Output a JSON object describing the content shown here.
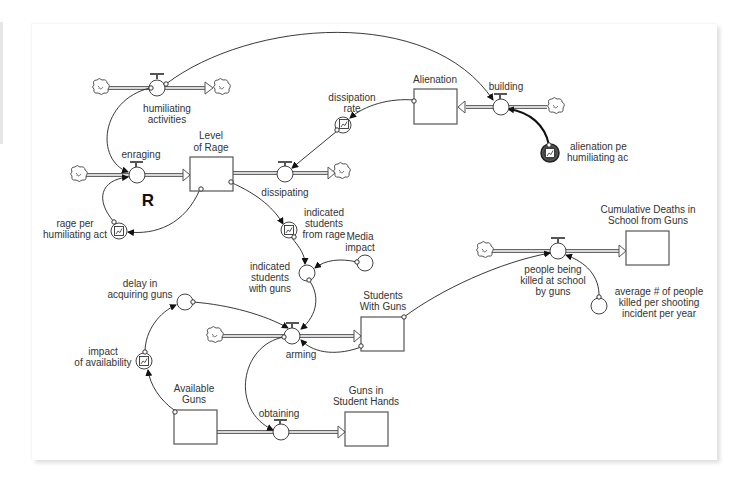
{
  "diagram": {
    "loop_marker": "R",
    "stocks": {
      "level_of_rage": {
        "line1": "Level",
        "line2": "of Rage"
      },
      "alienation": {
        "line1": "Alienation"
      },
      "students_with_guns": {
        "line1": "Students",
        "line2": "With Guns"
      },
      "available_guns": {
        "line1": "Available",
        "line2": "Guns"
      },
      "guns_in_student_hands": {
        "line1": "Guns in",
        "line2": "Student Hands"
      },
      "cumulative_deaths": {
        "line1": "Cumulative Deaths in",
        "line2": "School from Guns"
      }
    },
    "flows": {
      "humiliating_activities": {
        "line1": "humiliating",
        "line2": "activities"
      },
      "enraging": {
        "line1": "enraging"
      },
      "dissipating": {
        "line1": "dissipating"
      },
      "building": {
        "line1": "building"
      },
      "arming": {
        "line1": "arming"
      },
      "obtaining": {
        "line1": "obtaining"
      },
      "people_killed": {
        "line1": "people being",
        "line2": "killed at school",
        "line3": "by guns"
      }
    },
    "converters": {
      "dissipation_rate": {
        "line1": "dissipation",
        "line2": "rate",
        "type": "graphical"
      },
      "alienation_per_act": {
        "line1": "alienation pe",
        "line2": "humiliating ac",
        "type": "graphical-selected"
      },
      "rage_per_act": {
        "line1": "rage per",
        "line2": "humiliating act",
        "type": "graphical"
      },
      "indicated_from_rage": {
        "line1": "indicated",
        "line2": "students",
        "line3": "from rage",
        "type": "graphical"
      },
      "media_impact": {
        "line1": "Media",
        "line2": "impact",
        "type": "constant"
      },
      "indicated_with_guns": {
        "line1": "indicated",
        "line2": "students",
        "line3": "with guns",
        "type": "auxiliary"
      },
      "delay_acquiring": {
        "line1": "delay in",
        "line2": "acquiring guns",
        "type": "auxiliary"
      },
      "impact_availability": {
        "line1": "impact",
        "line2": "of availability",
        "type": "graphical"
      },
      "avg_killed": {
        "line1": "average # of people",
        "line2": "killed per shooting",
        "line3": "incident per year",
        "type": "constant"
      }
    }
  }
}
